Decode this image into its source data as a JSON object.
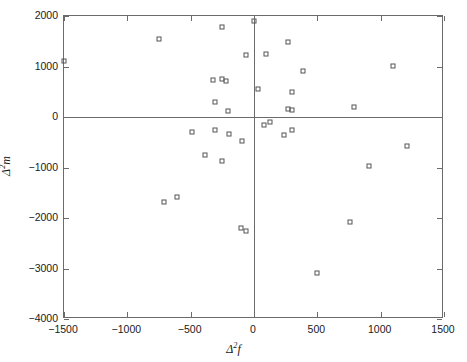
{
  "chart_data": {
    "type": "scatter",
    "title": "",
    "xlabel": "Δ²f",
    "ylabel": "Δ²m",
    "xlabel_parts": {
      "delta": "Δ",
      "exponent": "2",
      "variable": "f"
    },
    "ylabel_parts": {
      "delta": "Δ",
      "exponent": "2",
      "variable": "m"
    },
    "xlim": [
      -1500,
      1500
    ],
    "ylim": [
      -4000,
      2000
    ],
    "xticks": [
      -1500,
      -1000,
      -500,
      0,
      500,
      1000,
      1500
    ],
    "yticks": [
      2000,
      1000,
      0,
      -1000,
      -2000,
      -3000,
      -4000
    ],
    "xticklabels": [
      "-1500",
      "-1000",
      "-500",
      "0",
      "500",
      "1000",
      "1500"
    ],
    "yticklabels": [
      "2000",
      "1000",
      "0",
      "-1000",
      "-2000",
      "-3000",
      "-4000"
    ],
    "grid": false,
    "legend": null,
    "marker_style": "open-square",
    "marker_color": "#555555",
    "axis_color": "#6b6b6b",
    "background_color": "#ffffff",
    "reference_lines": [
      {
        "name": "x-zero",
        "orientation": "vertical",
        "value": 0
      },
      {
        "name": "y-zero",
        "orientation": "horizontal",
        "value": 0
      }
    ],
    "points": [
      {
        "x": -1500,
        "y": 1100
      },
      {
        "x": -750,
        "y": 1540
      },
      {
        "x": -255,
        "y": 1780
      },
      {
        "x": -65,
        "y": 1230
      },
      {
        "x": 0,
        "y": 1900
      },
      {
        "x": 95,
        "y": 1250
      },
      {
        "x": 265,
        "y": 1490
      },
      {
        "x": 390,
        "y": 920
      },
      {
        "x": 1100,
        "y": 1010
      },
      {
        "x": -320,
        "y": 740
      },
      {
        "x": -250,
        "y": 755
      },
      {
        "x": -225,
        "y": 720
      },
      {
        "x": 35,
        "y": 560
      },
      {
        "x": 300,
        "y": 500
      },
      {
        "x": -310,
        "y": 300
      },
      {
        "x": -205,
        "y": 120
      },
      {
        "x": 265,
        "y": 160
      },
      {
        "x": 300,
        "y": 130
      },
      {
        "x": 790,
        "y": 200
      },
      {
        "x": 75,
        "y": -155
      },
      {
        "x": 130,
        "y": -100
      },
      {
        "x": -490,
        "y": -300
      },
      {
        "x": -305,
        "y": -250
      },
      {
        "x": -200,
        "y": -345
      },
      {
        "x": -95,
        "y": -480
      },
      {
        "x": 235,
        "y": -350
      },
      {
        "x": 300,
        "y": -255
      },
      {
        "x": -390,
        "y": -760
      },
      {
        "x": -250,
        "y": -880
      },
      {
        "x": 1205,
        "y": -575
      },
      {
        "x": 905,
        "y": -975
      },
      {
        "x": -710,
        "y": -1680
      },
      {
        "x": -605,
        "y": -1590
      },
      {
        "x": -105,
        "y": -2190
      },
      {
        "x": -60,
        "y": -2255
      },
      {
        "x": 755,
        "y": -2085
      },
      {
        "x": 500,
        "y": -3090
      }
    ]
  }
}
